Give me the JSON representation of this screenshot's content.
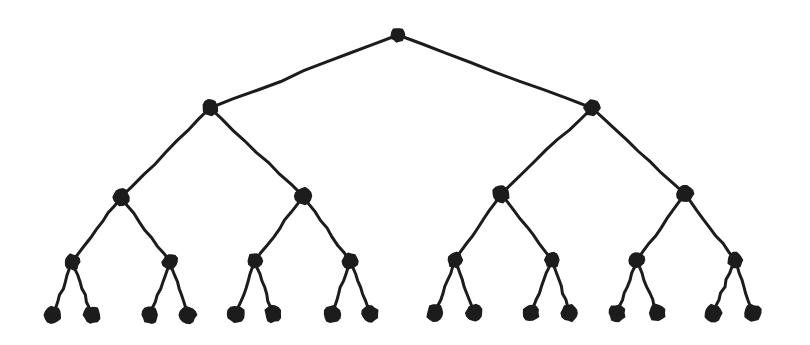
{
  "figure": {
    "kind": "node-link-diagram",
    "background_color": "#ffffff",
    "ink_color": "#1c1c1c",
    "node_fill_color": "#1c1c1c",
    "edge_color": "#1c1c1c",
    "edge_width": 3,
    "style": "hand-drawn-scanned",
    "canvas": {
      "width": 810,
      "height": 345
    },
    "levels": 5,
    "node_count": 31,
    "edge_count": 30,
    "leaf_count": 16,
    "branching_factor": 2
  },
  "chart_data": {
    "type": "diagram",
    "xlabel": "",
    "ylabel": "",
    "legend": [],
    "levels": [
      {
        "depth": 0,
        "y": 35,
        "node_radius": 7.5,
        "count": 1
      },
      {
        "depth": 1,
        "y": 108,
        "node_radius": 8.0,
        "count": 2
      },
      {
        "depth": 2,
        "y": 195,
        "node_radius": 8.5,
        "count": 4
      },
      {
        "depth": 3,
        "y": 261,
        "node_radius": 8.0,
        "count": 8
      },
      {
        "depth": 4,
        "y": 314,
        "node_radius": 8.5,
        "count": 16
      }
    ],
    "nodes": [
      {
        "id": "n0",
        "label": "root",
        "depth": 0,
        "x": 398,
        "y": 35,
        "r": 7.5
      },
      {
        "id": "n1",
        "label": "L",
        "depth": 1,
        "x": 210,
        "y": 108,
        "r": 8.2
      },
      {
        "id": "n2",
        "label": "R",
        "depth": 1,
        "x": 592,
        "y": 108,
        "r": 8.2
      },
      {
        "id": "n3",
        "label": "LL",
        "depth": 2,
        "x": 121,
        "y": 197,
        "r": 8.6
      },
      {
        "id": "n4",
        "label": "LR",
        "depth": 2,
        "x": 303,
        "y": 196,
        "r": 8.6
      },
      {
        "id": "n5",
        "label": "RL",
        "depth": 2,
        "x": 501,
        "y": 194,
        "r": 8.6
      },
      {
        "id": "n6",
        "label": "RR",
        "depth": 2,
        "x": 685,
        "y": 194,
        "r": 8.6
      },
      {
        "id": "n7",
        "label": "LLL",
        "depth": 3,
        "x": 72,
        "y": 262,
        "r": 8.0
      },
      {
        "id": "n8",
        "label": "LLR",
        "depth": 3,
        "x": 170,
        "y": 262,
        "r": 8.0
      },
      {
        "id": "n9",
        "label": "LRL",
        "depth": 3,
        "x": 255,
        "y": 261,
        "r": 8.0
      },
      {
        "id": "n10",
        "label": "LRR",
        "depth": 3,
        "x": 350,
        "y": 261,
        "r": 8.0
      },
      {
        "id": "n11",
        "label": "RLL",
        "depth": 3,
        "x": 455,
        "y": 260,
        "r": 8.0
      },
      {
        "id": "n12",
        "label": "RLR",
        "depth": 3,
        "x": 552,
        "y": 260,
        "r": 8.0
      },
      {
        "id": "n13",
        "label": "RRL",
        "depth": 3,
        "x": 637,
        "y": 260,
        "r": 8.0
      },
      {
        "id": "n14",
        "label": "RRR",
        "depth": 3,
        "x": 735,
        "y": 260,
        "r": 8.0
      },
      {
        "id": "n15",
        "label": "leaf1",
        "depth": 4,
        "x": 53,
        "y": 315,
        "r": 8.6
      },
      {
        "id": "n16",
        "label": "leaf2",
        "depth": 4,
        "x": 92,
        "y": 315,
        "r": 8.6
      },
      {
        "id": "n17",
        "label": "leaf3",
        "depth": 4,
        "x": 150,
        "y": 315,
        "r": 8.6
      },
      {
        "id": "n18",
        "label": "leaf4",
        "depth": 4,
        "x": 188,
        "y": 315,
        "r": 8.6
      },
      {
        "id": "n19",
        "label": "leaf5",
        "depth": 4,
        "x": 236,
        "y": 314,
        "r": 8.6
      },
      {
        "id": "n20",
        "label": "leaf6",
        "depth": 4,
        "x": 273,
        "y": 314,
        "r": 8.6
      },
      {
        "id": "n21",
        "label": "leaf7",
        "depth": 4,
        "x": 332,
        "y": 314,
        "r": 8.6
      },
      {
        "id": "n22",
        "label": "leaf8",
        "depth": 4,
        "x": 370,
        "y": 314,
        "r": 8.6
      },
      {
        "id": "n23",
        "label": "leaf9",
        "depth": 4,
        "x": 435,
        "y": 313,
        "r": 8.6
      },
      {
        "id": "n24",
        "label": "leaf10",
        "depth": 4,
        "x": 474,
        "y": 313,
        "r": 8.6
      },
      {
        "id": "n25",
        "label": "leaf11",
        "depth": 4,
        "x": 531,
        "y": 313,
        "r": 8.6
      },
      {
        "id": "n26",
        "label": "leaf12",
        "depth": 4,
        "x": 570,
        "y": 313,
        "r": 8.6
      },
      {
        "id": "n27",
        "label": "leaf13",
        "depth": 4,
        "x": 617,
        "y": 313,
        "r": 8.6
      },
      {
        "id": "n28",
        "label": "leaf14",
        "depth": 4,
        "x": 657,
        "y": 313,
        "r": 8.6
      },
      {
        "id": "n29",
        "label": "leaf15",
        "depth": 4,
        "x": 713,
        "y": 313,
        "r": 8.6
      },
      {
        "id": "n30",
        "label": "leaf16",
        "depth": 4,
        "x": 753,
        "y": 313,
        "r": 8.6
      }
    ],
    "edges": [
      {
        "from": "n0",
        "to": "n1"
      },
      {
        "from": "n0",
        "to": "n2"
      },
      {
        "from": "n1",
        "to": "n3"
      },
      {
        "from": "n1",
        "to": "n4"
      },
      {
        "from": "n2",
        "to": "n5"
      },
      {
        "from": "n2",
        "to": "n6"
      },
      {
        "from": "n3",
        "to": "n7"
      },
      {
        "from": "n3",
        "to": "n8"
      },
      {
        "from": "n4",
        "to": "n9"
      },
      {
        "from": "n4",
        "to": "n10"
      },
      {
        "from": "n5",
        "to": "n11"
      },
      {
        "from": "n5",
        "to": "n12"
      },
      {
        "from": "n6",
        "to": "n13"
      },
      {
        "from": "n6",
        "to": "n14"
      },
      {
        "from": "n7",
        "to": "n15"
      },
      {
        "from": "n7",
        "to": "n16"
      },
      {
        "from": "n8",
        "to": "n17"
      },
      {
        "from": "n8",
        "to": "n18"
      },
      {
        "from": "n9",
        "to": "n19"
      },
      {
        "from": "n9",
        "to": "n20"
      },
      {
        "from": "n10",
        "to": "n21"
      },
      {
        "from": "n10",
        "to": "n22"
      },
      {
        "from": "n11",
        "to": "n23"
      },
      {
        "from": "n11",
        "to": "n24"
      },
      {
        "from": "n12",
        "to": "n25"
      },
      {
        "from": "n12",
        "to": "n26"
      },
      {
        "from": "n13",
        "to": "n27"
      },
      {
        "from": "n13",
        "to": "n28"
      },
      {
        "from": "n14",
        "to": "n29"
      },
      {
        "from": "n14",
        "to": "n30"
      }
    ]
  }
}
